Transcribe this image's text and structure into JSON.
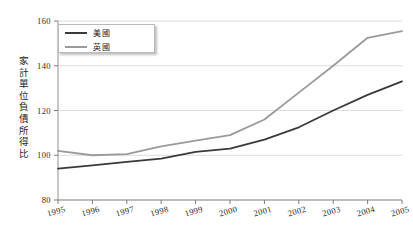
{
  "chart_data": {
    "type": "line",
    "title": "",
    "xlabel": "",
    "ylabel": "家計單位負債所得比",
    "x": [
      "1995",
      "1996",
      "1997",
      "1998",
      "1999",
      "2000",
      "2001",
      "2002",
      "2003",
      "2004",
      "2005"
    ],
    "xlim": [
      1995,
      2005
    ],
    "ylim": [
      80,
      160
    ],
    "yticks": [
      "80",
      "100",
      "120",
      "140",
      "160"
    ],
    "ytick_values": [
      80,
      100,
      120,
      140,
      160
    ],
    "grid": "horizontal",
    "legend_position": "top-left",
    "series": [
      {
        "name": "美國",
        "color": "#3a3a3a",
        "values": [
          94,
          95.5,
          97,
          98.5,
          101.5,
          103,
          107,
          112.5,
          120,
          127,
          133
        ]
      },
      {
        "name": "英國",
        "color": "#9a9a9a",
        "values": [
          102,
          100,
          100.5,
          104,
          106.5,
          109,
          116,
          128,
          140,
          152.5,
          155.5
        ]
      }
    ]
  },
  "axis": {
    "y_title_chars": [
      "家",
      "計",
      "單",
      "位",
      "負",
      "債",
      "所",
      "得",
      "比"
    ]
  }
}
